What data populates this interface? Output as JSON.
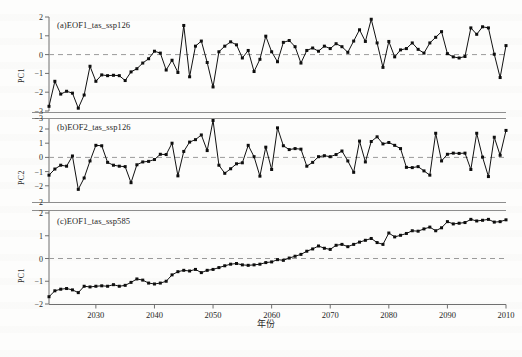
{
  "figure": {
    "xaxis_label": "年份",
    "xtick_labels": [
      "2030",
      "2040",
      "2050",
      "2060",
      "2070",
      "2080",
      "2090",
      "2010"
    ],
    "xticks": [
      2030,
      2040,
      2050,
      2060,
      2070,
      2080,
      2090,
      2100
    ],
    "xlim": [
      2022,
      2100
    ]
  },
  "chart_data": [
    {
      "type": "line",
      "title": "(a)EOF1_tas_ssp126",
      "ylabel": "PC1",
      "xlabel": "年份",
      "xlim": [
        2022,
        2100
      ],
      "ylim": [
        -3,
        2
      ],
      "yticks": [
        -3,
        -2,
        -1,
        0,
        1,
        2
      ],
      "ytick_labels": [
        "-3",
        "-2",
        "-1",
        "0",
        "1",
        "2"
      ],
      "grid": false,
      "legend": "none",
      "annotations": [
        "dashed zero reference line at y=0"
      ],
      "x": [
        2022,
        2023,
        2024,
        2025,
        2026,
        2027,
        2028,
        2029,
        2030,
        2031,
        2032,
        2033,
        2034,
        2035,
        2036,
        2037,
        2038,
        2039,
        2040,
        2041,
        2042,
        2043,
        2044,
        2045,
        2046,
        2047,
        2048,
        2049,
        2050,
        2051,
        2052,
        2053,
        2054,
        2055,
        2056,
        2057,
        2058,
        2059,
        2060,
        2061,
        2062,
        2063,
        2064,
        2065,
        2066,
        2067,
        2068,
        2069,
        2070,
        2071,
        2072,
        2073,
        2074,
        2075,
        2076,
        2077,
        2078,
        2079,
        2080,
        2081,
        2082,
        2083,
        2084,
        2085,
        2086,
        2087,
        2088,
        2089,
        2090,
        2091,
        2092,
        2093,
        2094,
        2095,
        2096,
        2097,
        2098,
        2099,
        2100
      ],
      "values": [
        -2.75,
        -1.42,
        -2.1,
        -1.95,
        -2.05,
        -2.85,
        -2.15,
        -0.62,
        -1.42,
        -1.08,
        -1.12,
        -1.1,
        -1.12,
        -1.38,
        -0.92,
        -0.75,
        -0.45,
        -0.22,
        0.18,
        0.08,
        -0.82,
        -0.3,
        -0.95,
        1.55,
        -1.18,
        0.45,
        0.72,
        -0.42,
        -1.72,
        0.15,
        0.45,
        0.68,
        0.52,
        -0.18,
        0.22,
        -0.9,
        -0.25,
        0.98,
        0.15,
        -0.38,
        0.65,
        0.75,
        0.42,
        -0.45,
        0.22,
        0.35,
        0.18,
        0.45,
        0.32,
        0.58,
        0.42,
        0.12,
        0.72,
        1.32,
        0.7,
        1.88,
        0.62,
        -0.68,
        0.7,
        -0.12,
        0.25,
        0.32,
        0.62,
        0.28,
        0.08,
        0.62,
        0.92,
        1.22,
        0.05,
        -0.12,
        -0.18,
        -0.1,
        1.42,
        1.08,
        1.48,
        1.42,
        0.02,
        -1.22,
        0.48,
        1.25
      ]
    },
    {
      "type": "line",
      "title": "(b)EOF2_tas_ssp126",
      "ylabel": "PC2",
      "xlabel": "年份",
      "xlim": [
        2022,
        2100
      ],
      "ylim": [
        -3,
        3
      ],
      "yticks": [
        -2,
        -1,
        0,
        1,
        2
      ],
      "ytick_labels": [
        "-2",
        "-1",
        "0",
        "1",
        "2"
      ],
      "grid": false,
      "legend": "none",
      "annotations": [
        "dashed zero reference line at y=0"
      ],
      "x": [
        2022,
        2023,
        2024,
        2025,
        2026,
        2027,
        2028,
        2029,
        2030,
        2031,
        2032,
        2033,
        2034,
        2035,
        2036,
        2037,
        2038,
        2039,
        2040,
        2041,
        2042,
        2043,
        2044,
        2045,
        2046,
        2047,
        2048,
        2049,
        2050,
        2051,
        2052,
        2053,
        2054,
        2055,
        2056,
        2057,
        2058,
        2059,
        2060,
        2061,
        2062,
        2063,
        2064,
        2065,
        2066,
        2067,
        2068,
        2069,
        2070,
        2071,
        2072,
        2073,
        2074,
        2075,
        2076,
        2077,
        2078,
        2079,
        2080,
        2081,
        2082,
        2083,
        2084,
        2085,
        2086,
        2087,
        2088,
        2089,
        2090,
        2091,
        2092,
        2093,
        2094,
        2095,
        2096,
        2097,
        2098,
        2099,
        2100
      ],
      "values": [
        -1.25,
        -0.82,
        -0.55,
        -0.62,
        0.1,
        -2.25,
        -1.45,
        -0.25,
        0.85,
        0.82,
        -0.35,
        -0.55,
        -0.62,
        -0.65,
        -1.78,
        -0.52,
        -0.32,
        -0.28,
        -0.15,
        0.22,
        0.2,
        1.0,
        -1.3,
        0.42,
        1.08,
        1.25,
        1.58,
        0.48,
        2.6,
        -0.55,
        -1.12,
        -0.8,
        -0.45,
        -0.38,
        0.85,
        0.05,
        -1.32,
        0.72,
        -0.85,
        2.08,
        0.82,
        0.55,
        0.62,
        0.58,
        -0.62,
        -0.35,
        0.05,
        0.12,
        0.05,
        0.2,
        0.45,
        -0.25,
        -1.05,
        1.15,
        -0.32,
        1.12,
        1.45,
        0.95,
        1.05,
        0.85,
        0.62,
        -0.7,
        -0.72,
        -0.65,
        -0.95,
        -1.25,
        1.7,
        -0.25,
        0.22,
        0.3,
        0.28,
        0.3,
        -0.85,
        1.7,
        0.02,
        -1.35,
        1.42,
        0.15,
        1.9,
        0.6,
        -1.1,
        -1.02
      ]
    },
    {
      "type": "line",
      "title": "(c)EOF1_tas_ssp585",
      "ylabel": "PC1",
      "xlabel": "年份",
      "xlim": [
        2022,
        2100
      ],
      "ylim": [
        -2,
        2
      ],
      "yticks": [
        -2,
        -1,
        0,
        1,
        2
      ],
      "ytick_labels": [
        "-2",
        "-1",
        "0",
        "1",
        "2"
      ],
      "grid": false,
      "legend": "none",
      "annotations": [
        "dashed zero reference line at y=0",
        "monotonic warming trend"
      ],
      "x": [
        2022,
        2023,
        2024,
        2025,
        2026,
        2027,
        2028,
        2029,
        2030,
        2031,
        2032,
        2033,
        2034,
        2035,
        2036,
        2037,
        2038,
        2039,
        2040,
        2041,
        2042,
        2043,
        2044,
        2045,
        2046,
        2047,
        2048,
        2049,
        2050,
        2051,
        2052,
        2053,
        2054,
        2055,
        2056,
        2057,
        2058,
        2059,
        2060,
        2061,
        2062,
        2063,
        2064,
        2065,
        2066,
        2067,
        2068,
        2069,
        2070,
        2071,
        2072,
        2073,
        2074,
        2075,
        2076,
        2077,
        2078,
        2079,
        2080,
        2081,
        2082,
        2083,
        2084,
        2085,
        2086,
        2087,
        2088,
        2089,
        2090,
        2091,
        2092,
        2093,
        2094,
        2095,
        2096,
        2097,
        2098,
        2099,
        2100
      ],
      "values": [
        -1.68,
        -1.42,
        -1.35,
        -1.32,
        -1.38,
        -1.5,
        -1.22,
        -1.25,
        -1.22,
        -1.2,
        -1.22,
        -1.15,
        -1.22,
        -1.18,
        -1.05,
        -0.9,
        -0.95,
        -1.08,
        -1.12,
        -1.08,
        -1.0,
        -0.72,
        -0.58,
        -0.52,
        -0.55,
        -0.48,
        -0.62,
        -0.52,
        -0.48,
        -0.4,
        -0.32,
        -0.25,
        -0.22,
        -0.28,
        -0.3,
        -0.28,
        -0.25,
        -0.18,
        -0.15,
        -0.05,
        -0.08,
        0.02,
        0.1,
        0.18,
        0.32,
        0.42,
        0.55,
        0.45,
        0.4,
        0.58,
        0.62,
        0.52,
        0.62,
        0.72,
        0.8,
        0.88,
        0.7,
        0.62,
        1.12,
        0.95,
        1.02,
        1.1,
        1.22,
        1.2,
        1.3,
        1.38,
        1.22,
        1.35,
        1.62,
        1.52,
        1.55,
        1.58,
        1.72,
        1.65,
        1.68,
        1.72,
        1.6,
        1.62,
        1.7
      ]
    }
  ]
}
